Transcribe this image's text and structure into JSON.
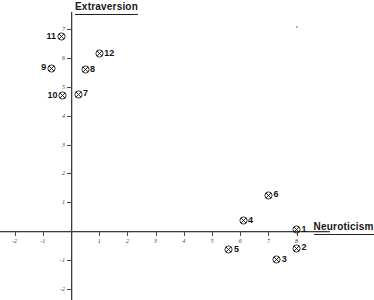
{
  "chart_data": {
    "type": "scatter",
    "title": "",
    "xlabel": "Neuroticism",
    "ylabel": "Extraversion",
    "xlim": [
      -2.6,
      9.2
    ],
    "ylim": [
      -2.4,
      7.6
    ],
    "grid": false,
    "legend": null,
    "marker_style": "circled-cross",
    "xticks": [
      -2,
      -1,
      1,
      2,
      3,
      4,
      5,
      6,
      7,
      8
    ],
    "xtick_labels": [
      "-2",
      "-1",
      "1",
      "2",
      "3",
      "4",
      "5",
      "6",
      "7",
      "8"
    ],
    "yticks": [
      -2,
      -1,
      1,
      2,
      3,
      4,
      5,
      6,
      7
    ],
    "ytick_labels": [
      "-2",
      "-1",
      "1",
      "2",
      "3",
      "4",
      "5",
      "6",
      "7"
    ],
    "points": [
      {
        "label": "1",
        "x": 8.0,
        "y": 0.05,
        "label_side": "right"
      },
      {
        "label": "2",
        "x": 8.0,
        "y": -0.6,
        "label_side": "right"
      },
      {
        "label": "3",
        "x": 7.3,
        "y": -1.0,
        "label_side": "right"
      },
      {
        "label": "4",
        "x": 6.1,
        "y": 0.35,
        "label_side": "right"
      },
      {
        "label": "5",
        "x": 5.6,
        "y": -0.65,
        "label_side": "right"
      },
      {
        "label": "6",
        "x": 7.0,
        "y": 1.25,
        "label_side": "right"
      },
      {
        "label": "7",
        "x": 0.25,
        "y": 4.75,
        "label_side": "right"
      },
      {
        "label": "8",
        "x": 0.5,
        "y": 5.6,
        "label_side": "right"
      },
      {
        "label": "9",
        "x": -0.7,
        "y": 5.65,
        "label_side": "left"
      },
      {
        "label": "10",
        "x": -0.3,
        "y": 4.7,
        "label_side": "left"
      },
      {
        "label": "11",
        "x": -0.35,
        "y": 6.75,
        "label_side": "left"
      },
      {
        "label": "12",
        "x": 1.0,
        "y": 6.15,
        "label_side": "right"
      }
    ],
    "artifacts": [
      {
        "name": "scan-speck",
        "x": 296,
        "y": 26
      }
    ]
  },
  "axes": {
    "x_title": "Neuroticism",
    "y_title": "Extraversion"
  },
  "colors": {
    "axis": "#3b3b3b",
    "marker": "#1a1a1a",
    "text": "#141414",
    "background": "#ffffff"
  }
}
